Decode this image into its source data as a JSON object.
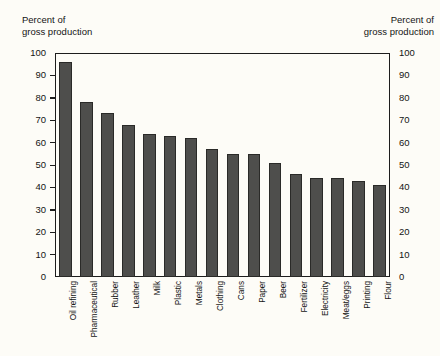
{
  "axes": {
    "left_caption": "Percent of\ngross production",
    "right_caption": "Percent of\ngross production",
    "ticks": [
      "100",
      "90",
      "80",
      "70",
      "60",
      "50",
      "40",
      "30",
      "20",
      "10",
      "0"
    ]
  },
  "chart_data": {
    "type": "bar",
    "title": "",
    "subtitle": "",
    "xlabel": "",
    "ylabel": "Percent of gross production",
    "ylim": [
      0,
      100
    ],
    "ytick_values": [
      0,
      10,
      20,
      30,
      40,
      50,
      60,
      70,
      80,
      90,
      100
    ],
    "grid": false,
    "legend": "none",
    "bar_color": "#4e4e4c",
    "background_color": "#fdfcf7",
    "axis_color": "#1d1d1d",
    "categories": [
      "Oil refining",
      "Pharmaceutical",
      "Rubber",
      "Leather",
      "Milk",
      "Plastic",
      "Metals",
      "Clothing",
      "Cans",
      "Paper",
      "Beer",
      "Fertilizer",
      "Electricity",
      "Meat/eggs",
      "Printing",
      "Flour"
    ],
    "values": [
      96,
      78,
      73,
      68,
      64,
      63,
      62,
      57,
      55,
      55,
      51,
      46,
      44,
      44,
      43,
      41
    ]
  }
}
